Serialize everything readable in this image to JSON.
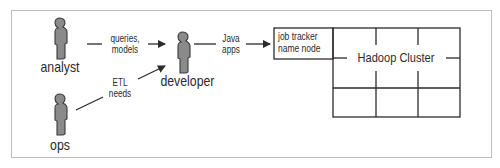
{
  "diagram": {
    "actors": [
      {
        "id": "analyst",
        "label": "analyst"
      },
      {
        "id": "ops",
        "label": "ops"
      },
      {
        "id": "developer",
        "label": "developer"
      }
    ],
    "edges": [
      {
        "from": "analyst",
        "to": "developer",
        "label_line1": "queries,",
        "label_line2": "models"
      },
      {
        "from": "ops",
        "to": "developer",
        "label_line1": "ETL",
        "label_line2": "needs"
      },
      {
        "from": "developer",
        "to": "job_tracker",
        "label_line1": "Java",
        "label_line2": "apps"
      }
    ],
    "job_tracker_box": {
      "line1": "job tracker",
      "line2": "name node"
    },
    "cluster": {
      "label": "Hadoop Cluster",
      "rows": 2,
      "cols": 3
    },
    "colors": {
      "figure_fill": "#8a8a8a",
      "figure_stroke": "#3a3a3a",
      "line": "#2b2b2b",
      "frame": "#bdbdbd"
    }
  }
}
